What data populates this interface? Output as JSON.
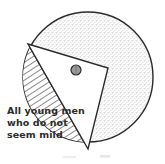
{
  "figure": {
    "background_color": "#ffffff",
    "ink_color": "#2b2b2b"
  },
  "shapes": {
    "outer_circle": {
      "name": "universe-circle",
      "fill_style": "stipple",
      "fill_color": "#cfcfcf",
      "stroke_color": "#2b2b2b",
      "center_x": 88,
      "center_y": 77,
      "radius": 65
    },
    "triangle_region": {
      "name": "white-triangle-region",
      "fill_style": "blank",
      "fill_color": "#ffffff",
      "stroke_color": "#2b2b2b",
      "vertices": "28,44 108,68 88,149"
    },
    "hatched_region": {
      "name": "hatched-region",
      "fill_style": "diagonal-hatch",
      "hatch_color": "#2b2b2b",
      "label": "All young men who do not seem mild"
    },
    "marker_dot": {
      "name": "marker-dot",
      "fill_color": "#8a8a8a",
      "stroke_color": "#2b2b2b",
      "center_x": 76,
      "center_y": 70,
      "radius": 5
    }
  },
  "labels": {
    "region_label": {
      "line1": "All young men",
      "line2": "who do not",
      "line3": "seem mild"
    }
  },
  "artifacts": {
    "smudge_left": "",
    "smudge_right": ""
  }
}
